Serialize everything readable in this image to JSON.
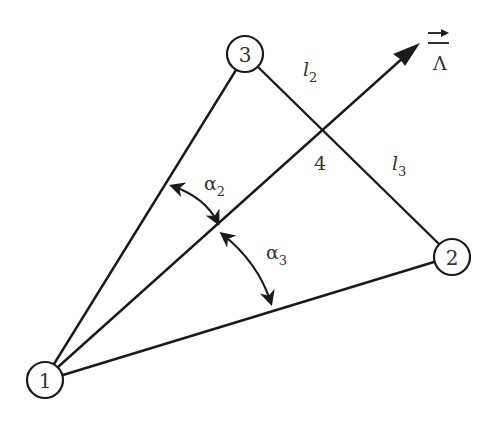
{
  "diagram": {
    "colors": {
      "stroke": "#1a1a1a",
      "text": "#333333",
      "background": "#ffffff"
    },
    "nodes": [
      {
        "id": "1",
        "label": "1",
        "x": 45,
        "y": 380,
        "r": 18
      },
      {
        "id": "2",
        "label": "2",
        "x": 452,
        "y": 257,
        "r": 18
      },
      {
        "id": "3",
        "label": "3",
        "x": 245,
        "y": 54,
        "r": 18
      }
    ],
    "intersection": {
      "label": "4",
      "x": 322,
      "y": 130
    },
    "edges": [
      {
        "from": "1",
        "to": "3"
      },
      {
        "from": "1",
        "to": "2"
      },
      {
        "from": "3",
        "to": "2"
      }
    ],
    "vector": {
      "from": "1",
      "tip": {
        "x": 420,
        "y": 43
      },
      "symbol": "Λ",
      "overarrow": "→"
    },
    "segment_labels": {
      "l2": {
        "main": "l",
        "sub": "2"
      },
      "l3": {
        "main": "l",
        "sub": "3"
      }
    },
    "angles": {
      "alpha2": {
        "main": "α",
        "sub": "2"
      },
      "alpha3": {
        "main": "α",
        "sub": "3"
      }
    }
  }
}
